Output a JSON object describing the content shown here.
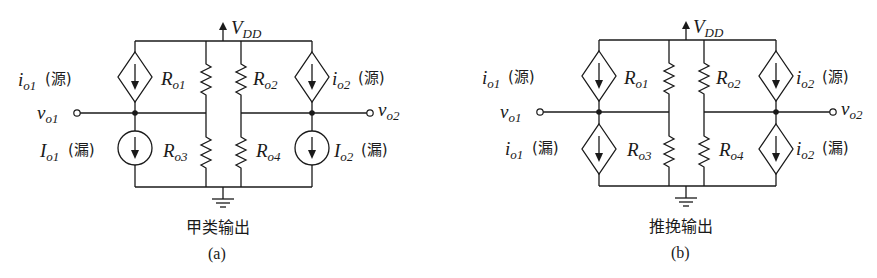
{
  "figure": {
    "panels": [
      {
        "id": "a",
        "caption": "(a)",
        "title": "甲类输出",
        "supply": "V",
        "supply_sub": "DD",
        "top_left_source": {
          "sym": "i",
          "sub": "o1",
          "note": "(源)",
          "type": "dependent"
        },
        "top_right_source": {
          "sym": "i",
          "sub": "o2",
          "note": "(源)",
          "type": "dependent"
        },
        "bottom_left_source": {
          "sym": "I",
          "sub": "o1",
          "note": "(漏)",
          "type": "independent"
        },
        "bottom_right_source": {
          "sym": "I",
          "sub": "o2",
          "note": "(漏)",
          "type": "independent"
        },
        "resistors": [
          {
            "sym": "R",
            "sub": "o1"
          },
          {
            "sym": "R",
            "sub": "o2"
          },
          {
            "sym": "R",
            "sub": "o3"
          },
          {
            "sym": "R",
            "sub": "o4"
          }
        ],
        "out_left": {
          "sym": "v",
          "sub": "o1"
        },
        "out_right": {
          "sym": "v",
          "sub": "o2"
        }
      },
      {
        "id": "b",
        "caption": "(b)",
        "title": "推挽输出",
        "supply": "V",
        "supply_sub": "DD",
        "top_left_source": {
          "sym": "i",
          "sub": "o1",
          "note": "(源)",
          "type": "dependent"
        },
        "top_right_source": {
          "sym": "i",
          "sub": "o2",
          "note": "(源)",
          "type": "dependent"
        },
        "bottom_left_source": {
          "sym": "i",
          "sub": "o1",
          "note": "(漏)",
          "type": "dependent"
        },
        "bottom_right_source": {
          "sym": "i",
          "sub": "o2",
          "note": "(漏)",
          "type": "dependent"
        },
        "resistors": [
          {
            "sym": "R",
            "sub": "o1"
          },
          {
            "sym": "R",
            "sub": "o2"
          },
          {
            "sym": "R",
            "sub": "o3"
          },
          {
            "sym": "R",
            "sub": "o4"
          }
        ],
        "out_left": {
          "sym": "v",
          "sub": "o1"
        },
        "out_right": {
          "sym": "v",
          "sub": "o2"
        }
      }
    ],
    "colors": {
      "ink": "#1a1a1a",
      "background": "#ffffff"
    }
  }
}
